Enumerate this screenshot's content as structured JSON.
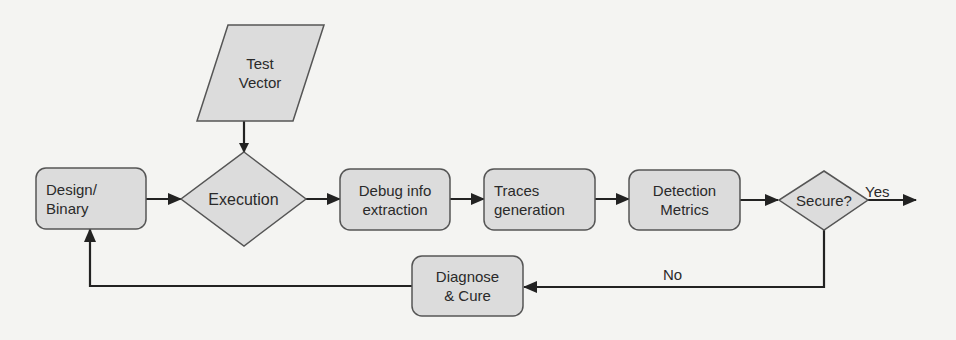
{
  "diagram": {
    "type": "flowchart",
    "colors": {
      "node_fill": "#dcdcdc",
      "node_stroke": "#555555",
      "edge": "#222222",
      "background": "#f4f4f2",
      "text": "#2a2a2a"
    },
    "nodes": [
      {
        "id": "test_vector",
        "shape": "parallelogram",
        "label": "Test\nVector"
      },
      {
        "id": "design_binary",
        "shape": "rounded-rect",
        "label": "Design/\nBinary"
      },
      {
        "id": "execution",
        "shape": "diamond",
        "label": "Execution"
      },
      {
        "id": "debug_info",
        "shape": "rounded-rect",
        "label": "Debug info\nextraction"
      },
      {
        "id": "traces",
        "shape": "rounded-rect",
        "label": "Traces\ngeneration"
      },
      {
        "id": "detection",
        "shape": "rounded-rect",
        "label": "Detection\nMetrics"
      },
      {
        "id": "secure",
        "shape": "diamond",
        "label": "Secure?"
      },
      {
        "id": "diagnose",
        "shape": "rounded-rect",
        "label": "Diagnose\n& Cure"
      }
    ],
    "edges": [
      {
        "from": "test_vector",
        "to": "execution",
        "label": ""
      },
      {
        "from": "design_binary",
        "to": "execution",
        "label": ""
      },
      {
        "from": "execution",
        "to": "debug_info",
        "label": ""
      },
      {
        "from": "debug_info",
        "to": "traces",
        "label": ""
      },
      {
        "from": "traces",
        "to": "detection",
        "label": ""
      },
      {
        "from": "detection",
        "to": "secure",
        "label": ""
      },
      {
        "from": "secure",
        "to": "exit",
        "label": "Yes"
      },
      {
        "from": "secure",
        "to": "diagnose",
        "label": "No"
      },
      {
        "from": "diagnose",
        "to": "design_binary",
        "label": ""
      }
    ]
  }
}
